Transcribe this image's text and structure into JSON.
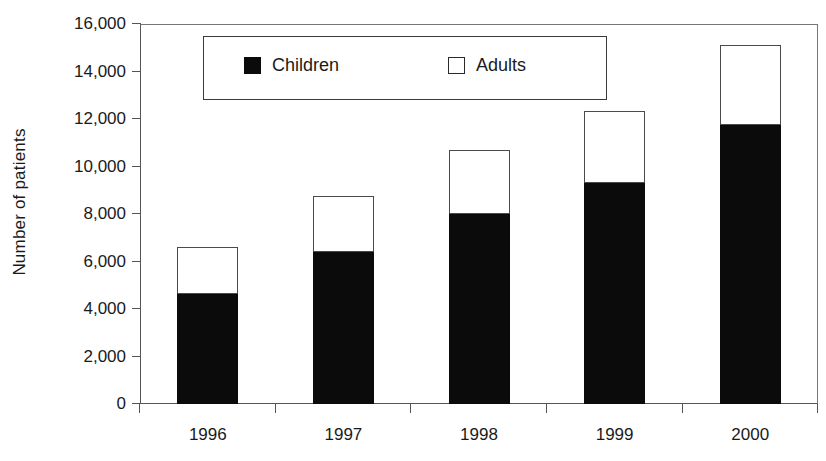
{
  "chart_data": {
    "type": "bar",
    "subtype": "stacked-vertical",
    "title": "",
    "xlabel": "",
    "ylabel": "Number of patients",
    "categories": [
      "1996",
      "1997",
      "1998",
      "1999",
      "2000"
    ],
    "series": [
      {
        "name": "Children",
        "color": "#0b0b0b",
        "marker": "filled-square",
        "values": [
          4650,
          6400,
          8000,
          9300,
          11750
        ]
      },
      {
        "name": "Adults",
        "color": "#ffffff",
        "marker": "hollow-square",
        "values": [
          1950,
          2350,
          2700,
          3050,
          3350
        ]
      }
    ],
    "totals": [
      6600,
      8750,
      10700,
      12350,
      15100
    ],
    "ylim": [
      0,
      16000
    ],
    "ytick_values": [
      0,
      2000,
      4000,
      6000,
      8000,
      10000,
      12000,
      14000,
      16000
    ],
    "ytick_labels": [
      "0",
      "2,000",
      "4,000",
      "6,000",
      "8,000",
      "10,000",
      "12,000",
      "14,000",
      "16,000"
    ],
    "grid": false,
    "legend_position": "top-left-inside",
    "legend_entries": [
      "Children",
      "Adults"
    ]
  },
  "legend": {
    "items": [
      {
        "label": "Children",
        "swatch": "filled"
      },
      {
        "label": "Adults",
        "swatch": "hollow"
      }
    ]
  },
  "axes": {
    "y_title": "Number of patients"
  }
}
